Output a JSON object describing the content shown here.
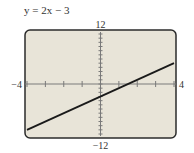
{
  "chart_data": {
    "type": "line",
    "title": "y = 2x − 3",
    "xlabel": "",
    "ylabel": "",
    "xlim": [
      -4,
      4
    ],
    "ylim": [
      -12,
      12
    ],
    "x_tick_step": 1,
    "y_tick_step": 1,
    "grid": false,
    "series": [
      {
        "name": "y = 2x − 3",
        "x": [
          -4,
          4
        ],
        "values": [
          -11,
          5
        ],
        "color": "#1a1a1a"
      }
    ],
    "tick_labels": {
      "x_min": "−4",
      "x_max": "4",
      "y_min": "−12",
      "y_max": "12"
    }
  },
  "colors": {
    "background": "#e8e4d8",
    "frame": "#2b2b2b",
    "axis": "#7a7a7a",
    "line": "#1a1a1a"
  }
}
